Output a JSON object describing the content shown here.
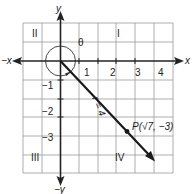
{
  "diagram": {
    "axes": {
      "x_pos_label": "x",
      "x_neg_label": "−x",
      "y_pos_label": "y",
      "y_neg_label": "−y"
    },
    "x_ticks": [
      "1",
      "2",
      "3",
      "4"
    ],
    "y_ticks": [
      "−1",
      "−2",
      "−3"
    ],
    "quadrants": {
      "I": "I",
      "II": "II",
      "III": "III",
      "IV": "IV"
    },
    "angle_label": "θ",
    "radius_label": "r = 4",
    "point_label": "P(√7, −3)",
    "point": {
      "x": 2.6458,
      "y": -3
    },
    "radius": 4,
    "grid": {
      "x_min": -2,
      "x_max": 6,
      "y_min": -6,
      "y_max": 2
    },
    "colors": {
      "grid": "#9a9a9a",
      "axis": "#222222",
      "ray": "#1a1a1a"
    }
  }
}
